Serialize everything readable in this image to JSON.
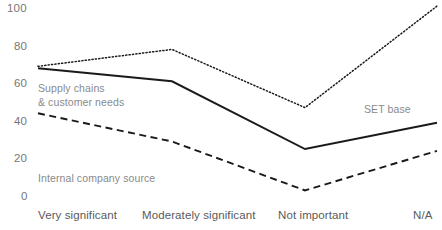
{
  "chart_data": {
    "type": "line",
    "title": "",
    "subtitle": "",
    "xlabel": "",
    "ylabel": "",
    "categories": [
      "Very significant",
      "Moderately significant",
      "Not important",
      "N/A"
    ],
    "yticks": [
      0,
      20,
      40,
      60,
      80,
      100
    ],
    "ytick_labels": [
      "0",
      "20",
      "40",
      "60",
      "80",
      "100"
    ],
    "ylim": [
      0,
      100
    ],
    "grid": false,
    "legend": "inline-annotations",
    "series": [
      {
        "name": "SET base",
        "style": "dotted",
        "color": "#1a1a1a",
        "values": [
          69,
          78,
          47,
          101
        ]
      },
      {
        "name": "Supply chains & customer needs",
        "style": "solid",
        "color": "#1a1a1a",
        "values": [
          68,
          61,
          25,
          39
        ]
      },
      {
        "name": "Internal company source",
        "style": "dashed",
        "color": "#1a1a1a",
        "values": [
          44,
          29,
          3,
          24
        ]
      }
    ],
    "annotations": [
      {
        "text": "SET base",
        "series": "SET base"
      },
      {
        "text": "Supply chains",
        "series": "Supply chains & customer needs"
      },
      {
        "text": "& customer needs",
        "series": "Supply chains & customer needs"
      },
      {
        "text": "Internal company source",
        "series": "Internal company source"
      }
    ]
  },
  "axis": {
    "y": {
      "t100": "100",
      "t80": "80",
      "t60": "60",
      "t40": "40",
      "t20": "20",
      "t0": "0"
    },
    "x": {
      "c0": "Very significant",
      "c1": "Moderately significant",
      "c2": "Not important",
      "c3": "N/A"
    }
  },
  "labels": {
    "set_base": "SET base",
    "supply_chains_line1": "Supply chains",
    "supply_chains_line2": "& customer needs",
    "internal_company_source": "Internal company source"
  }
}
